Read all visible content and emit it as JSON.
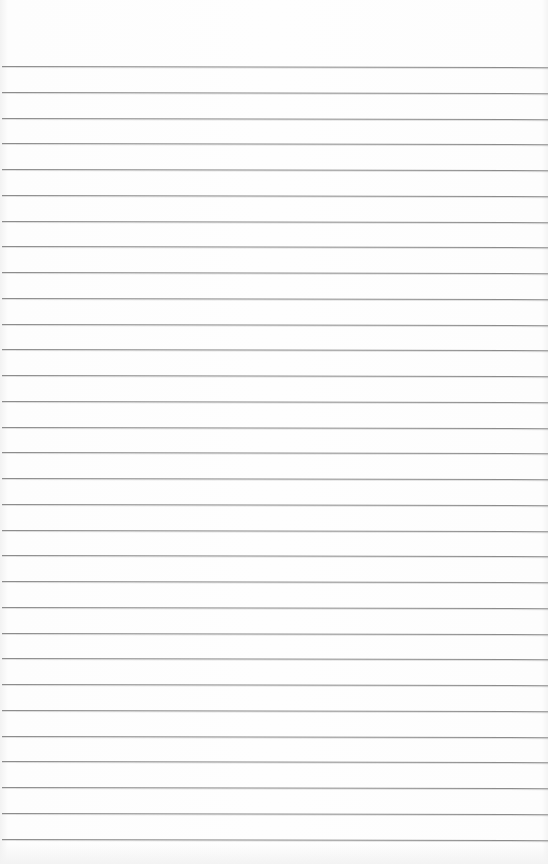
{
  "page": {
    "type": "lined-paper",
    "background_color": "#fdfdfd",
    "line_color": "#8c8c8c",
    "line_count": 31,
    "first_line_y": 66,
    "line_spacing": 25.75,
    "lines": []
  }
}
